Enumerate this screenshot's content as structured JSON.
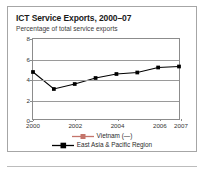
{
  "figure": {
    "title": "ICT Service Exports, 2000–07",
    "subtitle": "Percentage of total service exports"
  },
  "colors": {
    "series_vietnam": "#c4756b",
    "series_east_asia": "#000000",
    "axis": "#8c8c8c",
    "gridline": "#9a9a9a",
    "frame": "#a6a6a6",
    "text": "#1a1a1a"
  },
  "axes": {
    "y_ticks": [
      "0",
      "2",
      "4",
      "6",
      "8"
    ],
    "x_ticks": [
      "2000",
      "2002",
      "2004",
      "2006",
      "2007"
    ]
  },
  "legend": {
    "items": [
      {
        "label": "Vietnam (—)",
        "marker": "square-marker",
        "color": "#c4756b"
      },
      {
        "label": "East Asia & Pacific Region",
        "marker": "square-marker",
        "color": "#000000"
      }
    ]
  },
  "chart_data": {
    "type": "line",
    "title": "ICT Service Exports, 2000–07",
    "subtitle": "Percentage of total service exports",
    "xlabel": "",
    "ylabel": "Percentage of total service exports",
    "x": [
      2000,
      2001,
      2002,
      2003,
      2004,
      2005,
      2006,
      2007
    ],
    "xlim": [
      2000,
      2007
    ],
    "ylim": [
      0,
      8
    ],
    "y_ticks": [
      0,
      2,
      4,
      6,
      8
    ],
    "x_tick_labels": [
      "2000",
      "2002",
      "2004",
      "2006",
      "2007"
    ],
    "x_tick_values": [
      2000,
      2002,
      2004,
      2006,
      2007
    ],
    "grid": true,
    "legend_position": "bottom",
    "series": [
      {
        "name": "Vietnam (—)",
        "color": "#c4756b",
        "marker": "square",
        "values": [
          null,
          null,
          null,
          null,
          null,
          null,
          null,
          null
        ],
        "note": "no data available"
      },
      {
        "name": "East Asia & Pacific Region",
        "color": "#000000",
        "marker": "square",
        "values": [
          4.7,
          3.0,
          3.5,
          4.1,
          4.5,
          4.65,
          5.15,
          5.25
        ]
      }
    ]
  }
}
